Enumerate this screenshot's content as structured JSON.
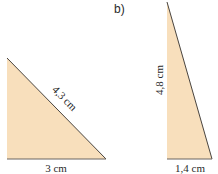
{
  "colors": {
    "fill": "#F8DFBC",
    "stroke": "#4a4540",
    "text": "#2a2a2a"
  },
  "figure_b_label": "b)",
  "triangle_a": {
    "base_label": "3 cm",
    "hypotenuse_label": "4,3 cm"
  },
  "triangle_b": {
    "height_label": "4,8 cm",
    "base_label": "1,4 cm"
  }
}
